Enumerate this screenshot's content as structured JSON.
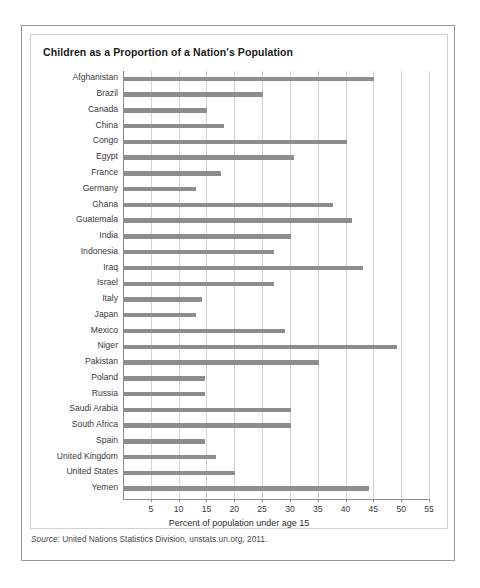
{
  "chart_data": {
    "type": "bar",
    "orientation": "horizontal",
    "title": "Children as a Proportion of a Nation's Population",
    "xlabel": "Percent of population under age 15",
    "ylabel": "",
    "xlim": [
      0,
      55
    ],
    "xticks": [
      5,
      10,
      15,
      20,
      25,
      30,
      35,
      40,
      45,
      50,
      55
    ],
    "grid": true,
    "legend": null,
    "bar_color": "#8d8d8d",
    "categories": [
      "Afghanistan",
      "Brazil",
      "Canada",
      "China",
      "Congo",
      "Egypt",
      "France",
      "Germany",
      "Ghana",
      "Guatemala",
      "India",
      "Indonesia",
      "Iraq",
      "Israel",
      "Italy",
      "Japan",
      "Mexico",
      "Niger",
      "Pakistan",
      "Poland",
      "Russia",
      "Saudi Arabia",
      "South Africa",
      "Spain",
      "United Kingdom",
      "United States",
      "Yemen"
    ],
    "values": [
      45,
      25,
      15,
      18,
      40,
      30.5,
      17.5,
      13,
      37.5,
      41,
      30,
      27,
      43,
      27,
      14,
      13,
      29,
      49,
      35,
      14.5,
      14.5,
      30,
      30,
      14.5,
      16.5,
      20,
      44
    ],
    "annotations": []
  },
  "source": {
    "label": "Source:",
    "text": "United Nations Statistics Division, unstats.un.org, 2011."
  }
}
